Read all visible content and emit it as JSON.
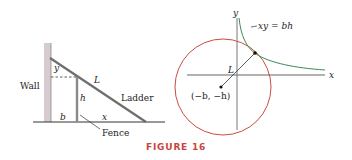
{
  "figure": {
    "caption": "FIGURE 16",
    "caption_color": "#c8453e"
  },
  "left_panel": {
    "labels": {
      "wall": "Wall",
      "ladder": "Ladder",
      "fence": "Fence",
      "L": "L",
      "y": "y",
      "h": "h",
      "b": "b",
      "x": "x"
    },
    "colors": {
      "ladder": "#6e6e6e",
      "wall_hatch": "#b9a8ae",
      "lines": "#333333"
    }
  },
  "right_panel": {
    "labels": {
      "y_axis": "y",
      "x_axis": "x",
      "curve": "xy = bh",
      "L": "L",
      "center": "(−b, −h)"
    },
    "colors": {
      "circle": "#c0392b",
      "hyperbola": "#3a8a55",
      "axes": "#555555"
    }
  }
}
